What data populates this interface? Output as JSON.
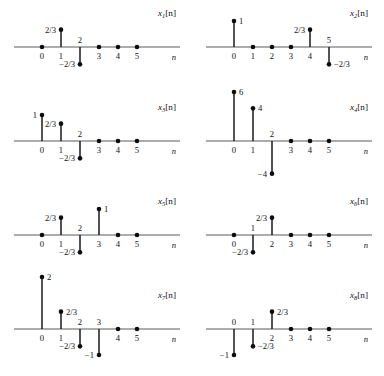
{
  "figure": {
    "axis_variable": "n",
    "tick_labels": [
      "0",
      "1",
      "2",
      "3",
      "4",
      "5"
    ],
    "stem_color": "#0d0d0d",
    "axis_color": "#5a5a5a",
    "panels": [
      {
        "id": "x1",
        "name_base": "x",
        "name_sub": "1",
        "name_brk": "[n]",
        "label": "x1[n]",
        "values": [
          0,
          0.6667,
          -0.6667,
          0,
          0,
          0
        ],
        "value_labels": [
          "",
          "2/3",
          "-2/3",
          "",
          "",
          ""
        ],
        "value_label_side": [
          "",
          "left",
          "left",
          "",
          "",
          ""
        ],
        "tick_label_pos": [
          "below",
          "below",
          "above",
          "below",
          "below",
          "below"
        ]
      },
      {
        "id": "x2",
        "name_base": "x",
        "name_sub": "2",
        "name_brk": "[n]",
        "label": "x2[n]",
        "values": [
          1,
          0,
          0,
          0,
          0.6667,
          -0.6667
        ],
        "value_labels": [
          "1",
          "",
          "",
          "",
          "2/3",
          "-2/3"
        ],
        "value_label_side": [
          "right",
          "",
          "",
          "",
          "left",
          "right"
        ],
        "tick_label_pos": [
          "below",
          "below",
          "below",
          "below",
          "below",
          "above"
        ]
      },
      {
        "id": "x3",
        "name_base": "x",
        "name_sub": "3",
        "name_brk": "[n]",
        "label": "x3[n]",
        "values": [
          1,
          0.6667,
          -0.6667,
          0,
          0,
          0
        ],
        "value_labels": [
          "1",
          "2/3",
          "-2/3",
          "",
          "",
          ""
        ],
        "value_label_side": [
          "left",
          "left",
          "left",
          "",
          "",
          ""
        ],
        "tick_label_pos": [
          "below",
          "below",
          "above",
          "below",
          "below",
          "below"
        ]
      },
      {
        "id": "x4",
        "name_base": "x",
        "name_sub": "4",
        "name_brk": "[n]",
        "label": "x4[n]",
        "values": [
          6,
          4,
          -4,
          0,
          0,
          0
        ],
        "value_labels": [
          "6",
          "4",
          "-4",
          "",
          "",
          ""
        ],
        "value_label_side": [
          "right",
          "right",
          "left",
          "",
          "",
          ""
        ],
        "tick_label_pos": [
          "below",
          "below",
          "above",
          "below",
          "below",
          "below"
        ]
      },
      {
        "id": "x5",
        "name_base": "x",
        "name_sub": "5",
        "name_brk": "[n]",
        "label": "x5[n]",
        "values": [
          0,
          0.6667,
          -0.6667,
          1,
          0,
          0
        ],
        "value_labels": [
          "",
          "2/3",
          "-2/3",
          "1",
          "",
          ""
        ],
        "value_label_side": [
          "",
          "left",
          "left",
          "right",
          "",
          ""
        ],
        "tick_label_pos": [
          "below",
          "below",
          "above",
          "below",
          "below",
          "below"
        ]
      },
      {
        "id": "x6",
        "name_base": "x",
        "name_sub": "6",
        "name_brk": "[n]",
        "label": "x6[n]",
        "values": [
          0,
          -0.6667,
          0.6667,
          0,
          0,
          0
        ],
        "value_labels": [
          "",
          "-2/3",
          "2/3",
          "",
          "",
          ""
        ],
        "value_label_side": [
          "",
          "left",
          "left",
          "",
          "",
          ""
        ],
        "tick_label_pos": [
          "below",
          "above",
          "below",
          "below",
          "below",
          "below"
        ]
      },
      {
        "id": "x7",
        "name_base": "x",
        "name_sub": "7",
        "name_brk": "[n]",
        "label": "x7[n]",
        "values": [
          2,
          0.6667,
          -0.6667,
          -1,
          0,
          0
        ],
        "value_labels": [
          "2",
          "2/3",
          "-2/3",
          "-1",
          "",
          ""
        ],
        "value_label_side": [
          "right",
          "right",
          "left",
          "left",
          "",
          ""
        ],
        "tick_label_pos": [
          "below",
          "below",
          "above",
          "above",
          "below",
          "below"
        ]
      },
      {
        "id": "x8",
        "name_base": "x",
        "name_sub": "8",
        "name_brk": "[n]",
        "label": "x8[n]",
        "values": [
          -1,
          -0.6667,
          0.6667,
          0,
          0,
          0
        ],
        "value_labels": [
          "-1",
          "-2/3",
          "2/3",
          "",
          "",
          ""
        ],
        "value_label_side": [
          "left",
          "right",
          "right",
          "",
          "",
          ""
        ],
        "tick_label_pos": [
          "above",
          "above",
          "below",
          "below",
          "below",
          "below"
        ]
      }
    ]
  }
}
